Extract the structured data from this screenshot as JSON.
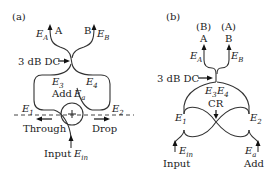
{
  "panel_a": {
    "label": "(a)",
    "port_A": "A",
    "port_B": "B",
    "field_A": "E",
    "field_A_sub": "A",
    "field_B": "E",
    "field_B_sub": "B",
    "coupler_label": "3 dB DC",
    "e3": "E",
    "e3_sub": "3",
    "e4": "E",
    "e4_sub": "4",
    "add_label": "Add",
    "ea": "E",
    "ea_sub": "a",
    "e1": "E",
    "e1_sub": "1",
    "e2": "E",
    "e2_sub": "2",
    "through_label": "Through",
    "drop_label": "Drop",
    "input_label": "Input",
    "ein": "E",
    "ein_sub": "in"
  },
  "panel_b": {
    "label": "(b)",
    "port_A_paren": "(B)",
    "port_B_paren": "(A)",
    "port_A": "A",
    "port_B": "B",
    "field_A": "E",
    "field_A_sub": "A",
    "field_B": "E",
    "field_B_sub": "B",
    "coupler_label": "3 dB DC",
    "e3": "E",
    "e3_sub": "3",
    "e4": "E",
    "e4_sub": "4",
    "cr_label": "CR",
    "e1": "E",
    "e1_sub": "1",
    "e2": "E",
    "e2_sub": "2",
    "input_label": "Input",
    "ein": "E",
    "ein_sub": "in",
    "add_label": "Add",
    "ea": "E",
    "ea_sub": "a"
  }
}
